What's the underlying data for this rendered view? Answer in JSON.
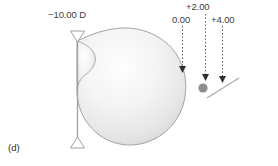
{
  "figure": {
    "caption": "(d)",
    "background_color": "#ffffff",
    "width": 278,
    "height": 166
  },
  "axis": {
    "name": "optical-axis",
    "color": "#b4b4b4",
    "y": 87,
    "x_start": 8,
    "x_end": 268
  },
  "lens": {
    "label": "−10.00 D",
    "color": "#9a9a9a",
    "x": 77,
    "y_top": 31,
    "y_bottom": 148,
    "label_x": 48,
    "label_y": 14
  },
  "eye": {
    "name": "eye-globe",
    "fill_light": "#fdfdfd",
    "fill_dark": "#d9d9d9",
    "stroke": "#9f9f9f",
    "center_x": 133,
    "center_y": 87
  },
  "markers": [
    {
      "label": "0.00",
      "x": 182,
      "label_x": 173,
      "label_y": 16,
      "tip_y": 72,
      "dash_top": 26
    },
    {
      "label": "+2.00",
      "x": 205,
      "label_x": 186,
      "label_y": 3,
      "tip_y": 80,
      "dash_top": 14
    },
    {
      "label": "+4.00",
      "x": 222,
      "label_x": 212,
      "label_y": 16,
      "tip_y": 82,
      "dash_top": 26
    }
  ],
  "focus_dot": {
    "name": "focal-point-dot",
    "x": 203,
    "y": 88,
    "r": 4.6,
    "color": "#8e8e8e"
  },
  "tilt_line": {
    "name": "tilted-image-plane",
    "x1": 207,
    "y1": 98,
    "x2": 239,
    "y2": 78,
    "color": "#a9a9a9"
  },
  "colors": {
    "text": "#3d3d3d",
    "line_gray": "#b4b4b4",
    "dark_marker": "#2f2f2f"
  }
}
